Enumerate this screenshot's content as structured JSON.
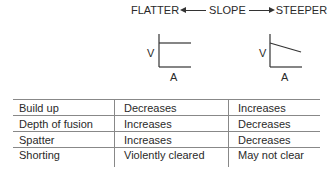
{
  "header": {
    "left": "FLATTER",
    "center": "SLOPE",
    "right": "STEEPER"
  },
  "graphs": [
    {
      "name": "flatter",
      "y_label": "V",
      "x_label": "A",
      "line": "horizontal"
    },
    {
      "name": "steeper",
      "y_label": "V",
      "x_label": "A",
      "line": "descending"
    }
  ],
  "table": {
    "rows": [
      [
        "Build up",
        "Decreases",
        "Increases"
      ],
      [
        "Depth of fusion",
        "Increases",
        "Decreases"
      ],
      [
        "Spatter",
        "Increases",
        "Decreases"
      ],
      [
        "Shorting",
        "Violently cleared",
        "May not clear"
      ]
    ]
  }
}
